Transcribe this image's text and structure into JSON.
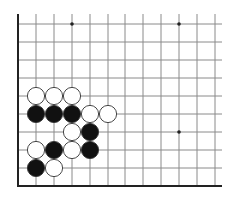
{
  "diagram": {
    "type": "go-board-fragment",
    "grid": {
      "columns_x": [
        18,
        36,
        54,
        72,
        90,
        108,
        125,
        143,
        161,
        179,
        197,
        215
      ],
      "rows_y": [
        24,
        42,
        60,
        78,
        96,
        114,
        132,
        150,
        168,
        186
      ],
      "top_extend_y": 14,
      "right_extend_x": 222,
      "left_edge": true,
      "bottom_edge": true,
      "line_color": "#8a8a8a",
      "edge_color": "#222222"
    },
    "star_points": [
      {
        "col": 3,
        "row": 0
      },
      {
        "col": 9,
        "row": 0
      },
      {
        "col": 9,
        "row": 6
      }
    ],
    "stones": [
      {
        "color": "white",
        "col": 1,
        "row": 4
      },
      {
        "color": "white",
        "col": 2,
        "row": 4
      },
      {
        "color": "white",
        "col": 3,
        "row": 4
      },
      {
        "color": "black",
        "col": 1,
        "row": 5
      },
      {
        "color": "black",
        "col": 2,
        "row": 5
      },
      {
        "color": "black",
        "col": 3,
        "row": 5
      },
      {
        "color": "white",
        "col": 4,
        "row": 5
      },
      {
        "color": "white",
        "col": 5,
        "row": 5
      },
      {
        "color": "white",
        "col": 3,
        "row": 6
      },
      {
        "color": "black",
        "col": 4,
        "row": 6
      },
      {
        "color": "white",
        "col": 1,
        "row": 7
      },
      {
        "color": "black",
        "col": 2,
        "row": 7
      },
      {
        "color": "white",
        "col": 3,
        "row": 7
      },
      {
        "color": "black",
        "col": 4,
        "row": 7
      },
      {
        "color": "black",
        "col": 1,
        "row": 8
      },
      {
        "color": "white",
        "col": 2,
        "row": 8
      }
    ],
    "colors": {
      "black_stone": "#111111",
      "white_stone": "#ffffff",
      "stone_outline": "#333333",
      "background": "#ffffff"
    }
  }
}
